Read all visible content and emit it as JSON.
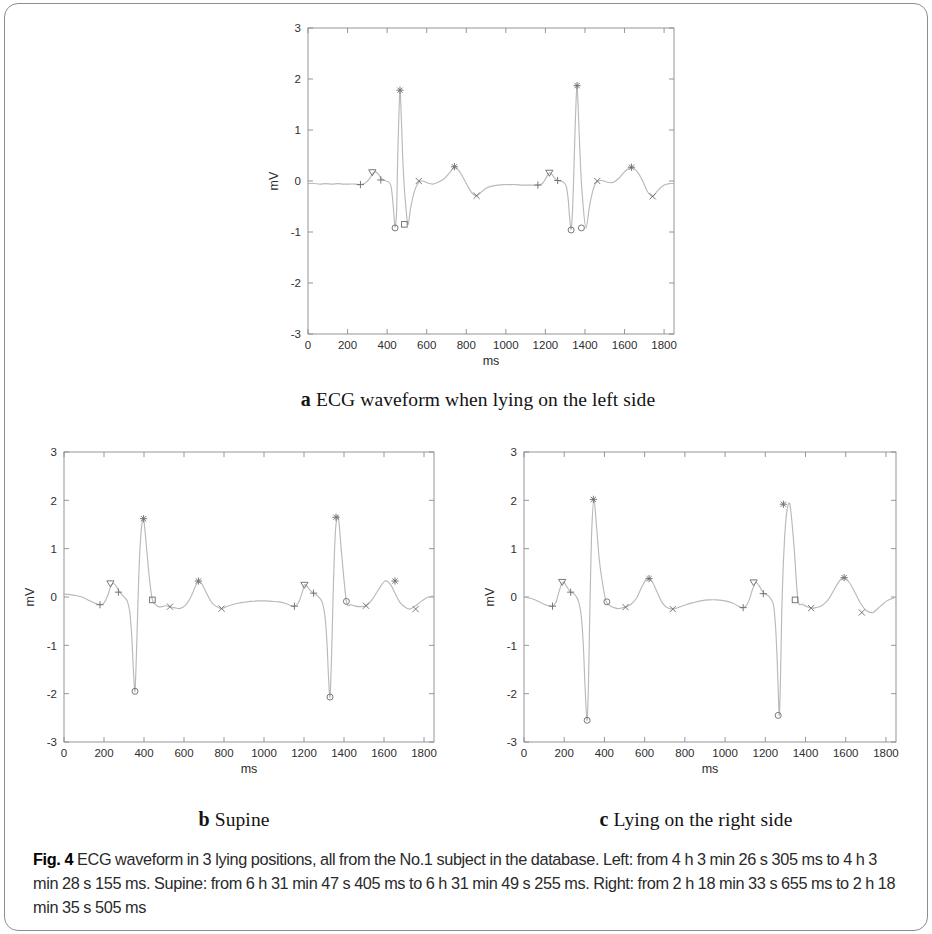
{
  "figure": {
    "label": "Fig. 4",
    "caption": "ECG waveform in 3 lying positions, all from the No.1 subject in the database. Left: from 4 h 3 min 26 s 305 ms to 4 h 3 min 28 s 155 ms. Supine: from 6 h 31 min 47 s 405 ms to 6 h 31 min 49 s 255 ms. Right: from 2 h 18 min 33 s 655 ms to 2 h 18 min 35 s 505 ms"
  },
  "subcaptions": {
    "a": {
      "letter": "a",
      "text": "ECG waveform when lying on the left side"
    },
    "b": {
      "letter": "b",
      "text": "Supine"
    },
    "c": {
      "letter": "c",
      "text": "Lying on the right side"
    }
  },
  "chart_data": [
    {
      "id": "a",
      "type": "line",
      "title": "ECG waveform when lying on the left side",
      "xlabel": "ms",
      "ylabel": "mV",
      "xlim": [
        0,
        1850
      ],
      "ylim": [
        -3,
        3
      ],
      "xticks": [
        0,
        200,
        400,
        600,
        800,
        1000,
        1200,
        1400,
        1600,
        1800
      ],
      "yticks": [
        -3,
        -2,
        -1,
        0,
        1,
        2,
        3
      ],
      "grid": false,
      "legend": "none",
      "line_color": "#b9b9bd",
      "marker_color": "#6f6f78",
      "series": [
        {
          "name": "ECG lead",
          "x": [
            0,
            30,
            60,
            90,
            120,
            150,
            180,
            210,
            240,
            265,
            290,
            310,
            325,
            340,
            355,
            368,
            380,
            395,
            408,
            418,
            425,
            432,
            440,
            448,
            452,
            458,
            465,
            472,
            480,
            490,
            505,
            520,
            540,
            560,
            580,
            605,
            630,
            660,
            690,
            715,
            740,
            760,
            785,
            810,
            830,
            852,
            875,
            900,
            930,
            960,
            990,
            1020,
            1050,
            1080,
            1110,
            1140,
            1162,
            1185,
            1205,
            1220,
            1235,
            1248,
            1262,
            1275,
            1290,
            1305,
            1315,
            1322,
            1330,
            1338,
            1345,
            1352,
            1360,
            1368,
            1378,
            1390,
            1405,
            1425,
            1445,
            1462,
            1485,
            1510,
            1540,
            1570,
            1600,
            1635,
            1665,
            1692,
            1715,
            1742,
            1770,
            1800,
            1830,
            1850
          ],
          "y": [
            -0.05,
            -0.05,
            -0.06,
            -0.05,
            -0.06,
            -0.05,
            -0.06,
            -0.06,
            -0.06,
            -0.07,
            -0.04,
            0.04,
            0.13,
            0.18,
            0.14,
            0.06,
            0.02,
            0.0,
            -0.02,
            -0.08,
            -0.25,
            -0.55,
            -0.9,
            -0.6,
            0.2,
            1.1,
            1.78,
            1.2,
            0.35,
            -0.3,
            -0.85,
            -0.5,
            -0.18,
            -0.02,
            0.0,
            -0.04,
            -0.06,
            -0.02,
            0.05,
            0.16,
            0.27,
            0.22,
            0.06,
            -0.12,
            -0.24,
            -0.29,
            -0.22,
            -0.14,
            -0.1,
            -0.08,
            -0.07,
            -0.07,
            -0.07,
            -0.08,
            -0.08,
            -0.08,
            -0.08,
            -0.05,
            0.07,
            0.16,
            0.12,
            0.05,
            0.01,
            0.0,
            -0.02,
            -0.1,
            -0.35,
            -0.7,
            -0.95,
            -0.5,
            0.35,
            1.25,
            1.87,
            1.2,
            0.25,
            -0.45,
            -0.92,
            -0.45,
            -0.12,
            -0.01,
            0.01,
            -0.02,
            -0.03,
            0.05,
            0.18,
            0.27,
            0.18,
            0.0,
            -0.2,
            -0.3,
            -0.18,
            -0.08,
            -0.05,
            -0.05
          ]
        }
      ],
      "annotations": [
        {
          "marker": "plus",
          "x": 265,
          "y": -0.07,
          "label": "P-onset"
        },
        {
          "marker": "triangle",
          "x": 325,
          "y": 0.17,
          "label": "P-peak"
        },
        {
          "marker": "plus",
          "x": 368,
          "y": 0.02,
          "label": "P-offset"
        },
        {
          "marker": "circle",
          "x": 440,
          "y": -0.92,
          "label": "Q"
        },
        {
          "marker": "star",
          "x": 465,
          "y": 1.78,
          "label": "R"
        },
        {
          "marker": "square",
          "x": 487,
          "y": -0.85,
          "label": "S"
        },
        {
          "marker": "cross",
          "x": 560,
          "y": 0.0,
          "label": "T-onset"
        },
        {
          "marker": "star",
          "x": 740,
          "y": 0.28,
          "label": "T-peak"
        },
        {
          "marker": "cross",
          "x": 852,
          "y": -0.29,
          "label": "T-offset"
        },
        {
          "marker": "plus",
          "x": 1162,
          "y": -0.08,
          "label": "P-onset"
        },
        {
          "marker": "triangle",
          "x": 1220,
          "y": 0.16,
          "label": "P-peak"
        },
        {
          "marker": "plus",
          "x": 1262,
          "y": 0.01,
          "label": "P-offset"
        },
        {
          "marker": "circle",
          "x": 1330,
          "y": -0.96,
          "label": "Q"
        },
        {
          "marker": "star",
          "x": 1360,
          "y": 1.87,
          "label": "R"
        },
        {
          "marker": "circle",
          "x": 1382,
          "y": -0.92,
          "label": "S"
        },
        {
          "marker": "cross",
          "x": 1462,
          "y": 0.0,
          "label": "T-onset"
        },
        {
          "marker": "star",
          "x": 1635,
          "y": 0.27,
          "label": "T-peak"
        },
        {
          "marker": "cross",
          "x": 1742,
          "y": -0.3,
          "label": "T-offset"
        }
      ]
    },
    {
      "id": "b",
      "type": "line",
      "title": "Supine",
      "xlabel": "ms",
      "ylabel": "mV",
      "xlim": [
        0,
        1850
      ],
      "ylim": [
        -3,
        3
      ],
      "xticks": [
        0,
        200,
        400,
        600,
        800,
        1000,
        1200,
        1400,
        1600,
        1800
      ],
      "yticks": [
        -3,
        -2,
        -1,
        0,
        1,
        2,
        3
      ],
      "grid": false,
      "legend": "none",
      "line_color": "#b9b9bd",
      "marker_color": "#6f6f78",
      "series": [
        {
          "name": "ECG lead",
          "x": [
            0,
            30,
            60,
            90,
            120,
            150,
            180,
            200,
            218,
            232,
            248,
            265,
            278,
            292,
            305,
            318,
            330,
            340,
            348,
            355,
            362,
            370,
            378,
            388,
            398,
            412,
            428,
            442,
            458,
            472,
            490,
            508,
            530,
            552,
            578,
            605,
            632,
            655,
            672,
            692,
            715,
            740,
            765,
            788,
            812,
            840,
            870,
            900,
            935,
            970,
            1005,
            1040,
            1075,
            1105,
            1130,
            1152,
            1172,
            1190,
            1202,
            1215,
            1232,
            1248,
            1262,
            1278,
            1292,
            1305,
            1315,
            1322,
            1330,
            1338,
            1345,
            1352,
            1360,
            1372,
            1388,
            1412,
            1435,
            1458,
            1480,
            1510,
            1540,
            1572,
            1605,
            1632,
            1655,
            1678,
            1702,
            1728,
            1758,
            1790,
            1820,
            1850
          ],
          "y": [
            0.06,
            0.05,
            0.03,
            0.0,
            -0.06,
            -0.12,
            -0.16,
            -0.12,
            0.02,
            0.2,
            0.28,
            0.2,
            0.1,
            0.04,
            -0.02,
            -0.1,
            -0.35,
            -0.9,
            -1.6,
            -1.95,
            -1.2,
            -0.1,
            0.85,
            1.45,
            1.62,
            1.05,
            0.35,
            -0.06,
            -0.16,
            -0.2,
            -0.2,
            -0.18,
            -0.2,
            -0.22,
            -0.24,
            -0.18,
            -0.02,
            0.2,
            0.33,
            0.25,
            0.06,
            -0.12,
            -0.2,
            -0.24,
            -0.2,
            -0.16,
            -0.13,
            -0.11,
            -0.09,
            -0.08,
            -0.08,
            -0.09,
            -0.1,
            -0.13,
            -0.17,
            -0.19,
            -0.12,
            0.08,
            0.25,
            0.22,
            0.13,
            0.08,
            0.04,
            -0.02,
            -0.12,
            -0.4,
            -0.95,
            -1.6,
            -2.07,
            -1.2,
            -0.05,
            0.9,
            1.5,
            1.65,
            0.9,
            -0.09,
            -0.16,
            -0.19,
            -0.2,
            -0.18,
            -0.06,
            0.15,
            0.33,
            0.26,
            0.08,
            -0.1,
            -0.2,
            -0.25,
            -0.18,
            -0.08,
            0.0,
            0.02
          ]
        }
      ],
      "annotations": [
        {
          "marker": "plus",
          "x": 180,
          "y": -0.16,
          "label": "P-onset"
        },
        {
          "marker": "triangle",
          "x": 232,
          "y": 0.28,
          "label": "P-peak"
        },
        {
          "marker": "plus",
          "x": 272,
          "y": 0.1,
          "label": "P-offset"
        },
        {
          "marker": "circle",
          "x": 355,
          "y": -1.95,
          "label": "Q"
        },
        {
          "marker": "star",
          "x": 398,
          "y": 1.62,
          "label": "R"
        },
        {
          "marker": "square",
          "x": 442,
          "y": -0.06,
          "label": "S"
        },
        {
          "marker": "cross",
          "x": 530,
          "y": -0.2,
          "label": "T-onset"
        },
        {
          "marker": "star",
          "x": 672,
          "y": 0.33,
          "label": "T-peak"
        },
        {
          "marker": "cross",
          "x": 788,
          "y": -0.24,
          "label": "T-offset"
        },
        {
          "marker": "plus",
          "x": 1152,
          "y": -0.19,
          "label": "P-onset"
        },
        {
          "marker": "triangle",
          "x": 1202,
          "y": 0.25,
          "label": "P-peak"
        },
        {
          "marker": "plus",
          "x": 1248,
          "y": 0.08,
          "label": "P-offset"
        },
        {
          "marker": "circle",
          "x": 1330,
          "y": -2.07,
          "label": "Q"
        },
        {
          "marker": "star",
          "x": 1360,
          "y": 1.65,
          "label": "R"
        },
        {
          "marker": "circle",
          "x": 1412,
          "y": -0.09,
          "label": "S"
        },
        {
          "marker": "cross",
          "x": 1510,
          "y": -0.18,
          "label": "T-onset"
        },
        {
          "marker": "star",
          "x": 1655,
          "y": 0.33,
          "label": "T-peak"
        },
        {
          "marker": "cross",
          "x": 1758,
          "y": -0.25,
          "label": "T-offset"
        }
      ]
    },
    {
      "id": "c",
      "type": "line",
      "title": "Lying on the right side",
      "xlabel": "ms",
      "ylabel": "mV",
      "xlim": [
        0,
        1850
      ],
      "ylim": [
        -3,
        3
      ],
      "xticks": [
        0,
        200,
        400,
        600,
        800,
        1000,
        1200,
        1400,
        1600,
        1800
      ],
      "yticks": [
        -3,
        -2,
        -1,
        0,
        1,
        2,
        3
      ],
      "grid": false,
      "legend": "none",
      "line_color": "#b9b9bd",
      "marker_color": "#6f6f78",
      "series": [
        {
          "name": "ECG lead",
          "x": [
            0,
            25,
            50,
            75,
            100,
            122,
            142,
            158,
            172,
            186,
            198,
            212,
            228,
            242,
            258,
            272,
            285,
            295,
            302,
            308,
            314,
            320,
            326,
            332,
            338,
            348,
            360,
            375,
            392,
            408,
            428,
            448,
            470,
            492,
            512,
            535,
            560,
            585,
            605,
            622,
            640,
            660,
            682,
            705,
            740,
            772,
            805,
            840,
            880,
            920,
            960,
            1000,
            1040,
            1062,
            1082,
            1100,
            1118,
            1135,
            1152,
            1168,
            1182,
            1196,
            1210,
            1225,
            1240,
            1250,
            1258,
            1264,
            1270,
            1276,
            1282,
            1292,
            1305,
            1322,
            1342,
            1362,
            1385,
            1408,
            1428,
            1452,
            1480,
            1512,
            1542,
            1568,
            1592,
            1618,
            1645,
            1672,
            1702,
            1735,
            1770,
            1805,
            1850
          ],
          "y": [
            0.0,
            -0.02,
            -0.05,
            -0.1,
            -0.15,
            -0.18,
            -0.19,
            -0.12,
            0.08,
            0.26,
            0.31,
            0.22,
            0.12,
            0.08,
            0.02,
            -0.1,
            -0.4,
            -1.0,
            -1.7,
            -2.25,
            -2.55,
            -1.9,
            -0.6,
            0.6,
            1.5,
            2.02,
            1.5,
            0.75,
            0.25,
            -0.09,
            -0.18,
            -0.22,
            -0.24,
            -0.22,
            -0.2,
            -0.14,
            -0.02,
            0.2,
            0.35,
            0.38,
            0.3,
            0.12,
            -0.08,
            -0.2,
            -0.25,
            -0.21,
            -0.16,
            -0.12,
            -0.08,
            -0.06,
            -0.06,
            -0.08,
            -0.13,
            -0.18,
            -0.22,
            -0.2,
            -0.08,
            0.14,
            0.3,
            0.24,
            0.14,
            0.07,
            0.04,
            -0.02,
            -0.15,
            -0.55,
            -1.2,
            -1.9,
            -2.45,
            -1.6,
            -0.3,
            0.9,
            1.7,
            1.92,
            1.1,
            -0.05,
            -0.15,
            -0.2,
            -0.23,
            -0.22,
            -0.18,
            -0.06,
            0.15,
            0.33,
            0.4,
            0.3,
            0.1,
            -0.12,
            -0.28,
            -0.32,
            -0.2,
            -0.08,
            0.0
          ]
        }
      ],
      "annotations": [
        {
          "marker": "plus",
          "x": 142,
          "y": -0.19,
          "label": "P-onset"
        },
        {
          "marker": "triangle",
          "x": 190,
          "y": 0.31,
          "label": "P-peak"
        },
        {
          "marker": "plus",
          "x": 232,
          "y": 0.1,
          "label": "P-offset"
        },
        {
          "marker": "circle",
          "x": 314,
          "y": -2.55,
          "label": "Q"
        },
        {
          "marker": "star",
          "x": 345,
          "y": 2.02,
          "label": "R"
        },
        {
          "marker": "circle",
          "x": 412,
          "y": -0.1,
          "label": "S"
        },
        {
          "marker": "cross",
          "x": 505,
          "y": -0.21,
          "label": "T-onset"
        },
        {
          "marker": "star",
          "x": 622,
          "y": 0.38,
          "label": "T-peak"
        },
        {
          "marker": "cross",
          "x": 740,
          "y": -0.25,
          "label": "T-offset"
        },
        {
          "marker": "plus",
          "x": 1090,
          "y": -0.22,
          "label": "P-onset"
        },
        {
          "marker": "triangle",
          "x": 1142,
          "y": 0.3,
          "label": "P-peak"
        },
        {
          "marker": "plus",
          "x": 1190,
          "y": 0.07,
          "label": "P-offset"
        },
        {
          "marker": "circle",
          "x": 1264,
          "y": -2.45,
          "label": "Q"
        },
        {
          "marker": "star",
          "x": 1290,
          "y": 1.92,
          "label": "R"
        },
        {
          "marker": "square",
          "x": 1348,
          "y": -0.06,
          "label": "S"
        },
        {
          "marker": "cross",
          "x": 1428,
          "y": -0.23,
          "label": "T-onset"
        },
        {
          "marker": "star",
          "x": 1592,
          "y": 0.4,
          "label": "T-peak"
        },
        {
          "marker": "cross",
          "x": 1680,
          "y": -0.32,
          "label": "T-offset"
        }
      ]
    }
  ]
}
